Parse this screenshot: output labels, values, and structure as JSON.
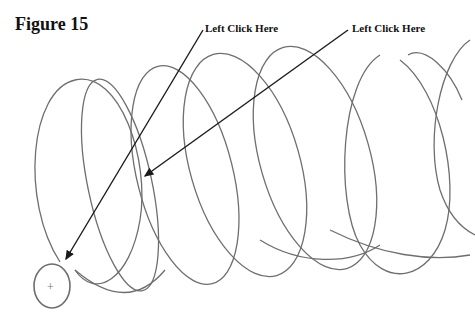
{
  "figure": {
    "title": "Figure 15",
    "callouts": [
      {
        "label": "Left Click Here",
        "target": "helix-start-circle"
      },
      {
        "label": "Left Click Here",
        "target": "helix-curve"
      }
    ],
    "origin_marker": "+"
  },
  "colors": {
    "curve": "#6e6e6e",
    "arrow": "#1a1a1a",
    "text": "#111111"
  }
}
